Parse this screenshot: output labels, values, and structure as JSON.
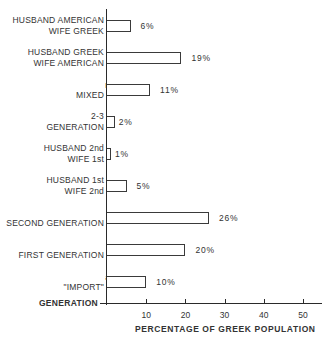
{
  "chart_data": {
    "type": "bar",
    "orientation": "horizontal",
    "title": "",
    "xlabel": "PERCENTAGE OF GREEK POPULATION",
    "ylabel": "GENERATION",
    "xlim": [
      0,
      55
    ],
    "xticks": [
      "10",
      "20",
      "30",
      "40",
      "50"
    ],
    "grid": false,
    "categories": [
      {
        "lines": [
          "HUSBAND AMERICAN",
          "WIFE GREEK"
        ],
        "sup": ""
      },
      {
        "lines": [
          "HUSBAND GREEK",
          "WIFE AMERICAN"
        ],
        "sup": ""
      },
      {
        "lines": [
          "MIXED"
        ],
        "sup": "b"
      },
      {
        "lines": [
          "2-3",
          "GENERATION"
        ],
        "sup": ""
      },
      {
        "lines": [
          "HUSBAND 2nd",
          "WIFE 1st"
        ],
        "sup": ""
      },
      {
        "lines": [
          "HUSBAND 1st",
          "WIFE 2nd"
        ],
        "sup": ""
      },
      {
        "lines": [
          "SECOND GENERATION"
        ],
        "sup": ""
      },
      {
        "lines": [
          "FIRST GENERATION"
        ],
        "sup": ""
      },
      {
        "lines": [
          "\"IMPORT\""
        ],
        "sup": "a"
      }
    ],
    "values": [
      6,
      19,
      11,
      2,
      1,
      5,
      26,
      20,
      10
    ],
    "value_labels": [
      "6%",
      "19%",
      "11%",
      "2%",
      "1%",
      "5%",
      "26%",
      "20%",
      "10%"
    ]
  },
  "axis": {
    "x_title": "PERCENTAGE OF GREEK POPULATION",
    "y_title": "GENERATION",
    "ticks": [
      "10",
      "20",
      "30",
      "40",
      "50"
    ]
  },
  "rows": [
    {
      "line1": "HUSBAND AMERICAN",
      "line2": "WIFE GREEK",
      "sup": "",
      "label": "6%"
    },
    {
      "line1": "HUSBAND GREEK",
      "line2": "WIFE AMERICAN",
      "sup": "",
      "label": "19%"
    },
    {
      "line1": "",
      "line2": "MIXED",
      "sup": "b",
      "label": "11%"
    },
    {
      "line1": "2-3",
      "line2": "GENERATION",
      "sup": "",
      "label": "2%"
    },
    {
      "line1": "HUSBAND 2nd",
      "line2": "WIFE 1st",
      "sup": "",
      "label": "1%"
    },
    {
      "line1": "HUSBAND 1st",
      "line2": "WIFE 2nd",
      "sup": "",
      "label": "5%"
    },
    {
      "line1": "",
      "line2": "SECOND GENERATION",
      "sup": "",
      "label": "26%"
    },
    {
      "line1": "",
      "line2": "FIRST GENERATION",
      "sup": "",
      "label": "20%"
    },
    {
      "line1": "",
      "line2": "\"IMPORT\"",
      "sup": "a",
      "label": "10%"
    }
  ]
}
